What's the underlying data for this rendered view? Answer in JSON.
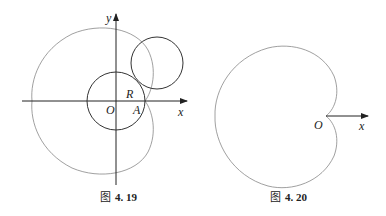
{
  "figures": [
    {
      "caption_prefix": "图",
      "caption_number": "4. 19",
      "labels": {
        "y": "y",
        "x": "x",
        "R": "R",
        "O": "O",
        "A": "A"
      },
      "description": "Cardioid generated by a circle of radius R rolling around a fixed circle of radius R centered at O, tracing point starting at A"
    },
    {
      "caption_prefix": "图",
      "caption_number": "4. 20",
      "labels": {
        "O": "O",
        "x": "x"
      },
      "description": "Cardioid with cusp at origin O, polar axis x"
    }
  ],
  "colors": {
    "stroke": "#333333",
    "thin_stroke": "#777777",
    "text": "#222222"
  }
}
